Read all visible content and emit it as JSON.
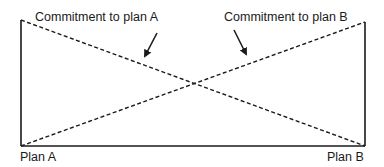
{
  "diagram": {
    "annotations": {
      "commitment_a": "Commitment to plan A",
      "commitment_b": "Commitment to plan B"
    },
    "axis": {
      "left_label": "Plan A",
      "right_label": "Plan B"
    },
    "lines": [
      {
        "name": "commitment-to-plan-a",
        "style": "dashed",
        "from": "high at Plan A",
        "to": "zero at Plan B"
      },
      {
        "name": "commitment-to-plan-b",
        "style": "dashed",
        "from": "zero at Plan A",
        "to": "high at Plan B"
      }
    ],
    "colors": {
      "stroke": "#1a1a1a",
      "background": "#ffffff"
    }
  }
}
